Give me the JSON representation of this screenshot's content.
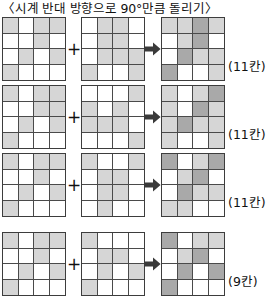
{
  "title": "〈시계 반대 방향으로 90°만큼 돌리기〉",
  "symbols": {
    "plus": "+",
    "arrow": "arrow-right-icon"
  },
  "legend": {
    "empty_color": "#ffffff",
    "single_color": "#d6d6d6",
    "overlap_color": "#a9a9a9",
    "line_color": "#4a4a4a"
  },
  "rows": [
    {
      "label": "(11칸)",
      "operand_a": [
        [
          1,
          0,
          1,
          1
        ],
        [
          0,
          0,
          1,
          0
        ],
        [
          0,
          1,
          0,
          1
        ],
        [
          1,
          0,
          0,
          0
        ]
      ],
      "operand_b": [
        [
          0,
          1,
          1,
          0
        ],
        [
          0,
          1,
          1,
          0
        ],
        [
          0,
          1,
          1,
          1
        ],
        [
          1,
          0,
          0,
          1
        ]
      ],
      "result": [
        [
          1,
          1,
          2,
          1
        ],
        [
          0,
          1,
          2,
          0
        ],
        [
          0,
          2,
          1,
          1
        ],
        [
          2,
          0,
          0,
          1
        ]
      ]
    },
    {
      "label": "(11칸)",
      "operand_a": [
        [
          1,
          0,
          1,
          1
        ],
        [
          0,
          0,
          1,
          1
        ],
        [
          0,
          1,
          0,
          1
        ],
        [
          1,
          0,
          0,
          0
        ]
      ],
      "operand_b": [
        [
          0,
          0,
          0,
          1
        ],
        [
          1,
          0,
          1,
          0
        ],
        [
          1,
          1,
          1,
          0
        ],
        [
          0,
          0,
          0,
          1
        ]
      ],
      "result": [
        [
          1,
          0,
          1,
          2
        ],
        [
          1,
          0,
          2,
          1
        ],
        [
          1,
          2,
          1,
          1
        ],
        [
          1,
          0,
          0,
          1
        ]
      ]
    },
    {
      "label": "(11칸)",
      "operand_a": [
        [
          1,
          0,
          1,
          1
        ],
        [
          0,
          0,
          1,
          0
        ],
        [
          0,
          1,
          0,
          1
        ],
        [
          1,
          0,
          0,
          0
        ]
      ],
      "operand_b": [
        [
          1,
          0,
          0,
          1
        ],
        [
          0,
          1,
          1,
          0
        ],
        [
          0,
          1,
          1,
          0
        ],
        [
          0,
          1,
          0,
          0
        ]
      ],
      "result": [
        [
          2,
          0,
          1,
          2
        ],
        [
          0,
          1,
          2,
          0
        ],
        [
          0,
          2,
          1,
          1
        ],
        [
          1,
          1,
          0,
          0
        ]
      ]
    },
    {
      "label": "(9칸)",
      "operand_a": [
        [
          1,
          0,
          1,
          1
        ],
        [
          0,
          0,
          1,
          0
        ],
        [
          0,
          1,
          0,
          1
        ],
        [
          1,
          0,
          0,
          0
        ]
      ],
      "operand_b": [
        [
          1,
          0,
          0,
          0
        ],
        [
          0,
          1,
          1,
          0
        ],
        [
          0,
          1,
          0,
          1
        ],
        [
          1,
          0,
          0,
          0
        ]
      ],
      "result": [
        [
          2,
          0,
          1,
          1
        ],
        [
          0,
          1,
          2,
          0
        ],
        [
          0,
          2,
          0,
          2
        ],
        [
          2,
          0,
          0,
          0
        ]
      ]
    }
  ]
}
